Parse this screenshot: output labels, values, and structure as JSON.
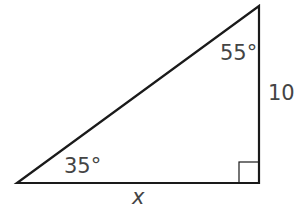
{
  "diagram": {
    "type": "right-triangle",
    "colors": {
      "stroke": "#1a1a1a",
      "label": "#444444",
      "background": "#ffffff"
    },
    "vertices": {
      "bottom_left": [
        17,
        183
      ],
      "bottom_right": [
        259,
        183
      ],
      "top_right": [
        259,
        6
      ]
    },
    "right_angle_marker": {
      "x": 239,
      "y": 162,
      "size": 20
    },
    "labels": {
      "angle_bottom_left": "35°",
      "angle_top": "55°",
      "side_vertical": "10",
      "side_horizontal": "x"
    }
  }
}
